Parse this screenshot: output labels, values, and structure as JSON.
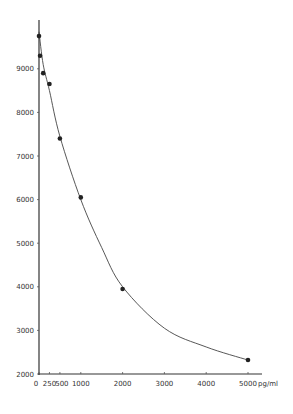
{
  "chart_data": {
    "type": "line",
    "title": "",
    "xlabel": "pg/ml",
    "ylabel": "",
    "xlim": [
      0,
      5500
    ],
    "ylim": [
      2000,
      10000
    ],
    "grid": false,
    "legend": null,
    "x_ticks": [
      0,
      250,
      500,
      1000,
      2000,
      3000,
      4000,
      5000
    ],
    "x_tick_labels": [
      "0",
      "250",
      "500",
      "1000",
      "2000",
      "3000",
      "4000",
      "5000"
    ],
    "y_ticks": [
      2000,
      3000,
      4000,
      5000,
      6000,
      7000,
      8000,
      9000
    ],
    "y_tick_labels": [
      "2000",
      "3000",
      "4000",
      "5000",
      "6000",
      "7000",
      "8000",
      "9000"
    ],
    "series": [
      {
        "name": "standard curve",
        "style": "points with smooth fitted curve",
        "x": [
          0,
          25,
          100,
          250,
          500,
          1000,
          2000,
          5000
        ],
        "values": [
          9750,
          9300,
          8900,
          8650,
          7400,
          6050,
          3950,
          2320
        ]
      }
    ]
  }
}
